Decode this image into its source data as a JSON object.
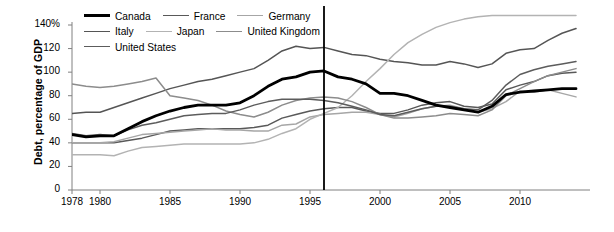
{
  "chart_data": {
    "type": "line",
    "title": "",
    "xlabel": "",
    "ylabel": "Debt, percentage of GDP",
    "xlim": [
      1978,
      2015
    ],
    "ylim": [
      0,
      148
    ],
    "grid": false,
    "legend_position": "top-left",
    "y_ticks": [
      0,
      20,
      40,
      60,
      80,
      100,
      120,
      140
    ],
    "y_tick_labels": [
      "0",
      "20",
      "40",
      "60",
      "80",
      "100",
      "120",
      "140%"
    ],
    "x_ticks": [
      1978,
      1980,
      1985,
      1990,
      1995,
      2000,
      2005,
      2010
    ],
    "x_tick_labels": [
      "1978",
      "1980",
      "1985",
      "1990",
      "1995",
      "2000",
      "2005",
      "2010"
    ],
    "x": [
      1978,
      1979,
      1980,
      1981,
      1982,
      1983,
      1984,
      1985,
      1986,
      1987,
      1988,
      1989,
      1990,
      1991,
      1992,
      1993,
      1994,
      1995,
      1996,
      1997,
      1998,
      1999,
      2000,
      2001,
      2002,
      2003,
      2004,
      2005,
      2006,
      2007,
      2008,
      2009,
      2010,
      2011,
      2012,
      2013,
      2014
    ],
    "annotations": [
      {
        "type": "vertical-line",
        "x": 1996,
        "color": "#000000",
        "label": ""
      }
    ],
    "series": [
      {
        "name": "Canada",
        "color": "#000000",
        "width": 2.8,
        "values": [
          47,
          45,
          46,
          46,
          52,
          58,
          63,
          67,
          70,
          72,
          72,
          72,
          74,
          80,
          88,
          94,
          96,
          100,
          101,
          96,
          94,
          90,
          82,
          82,
          80,
          76,
          72,
          70,
          68,
          66,
          71,
          81,
          83,
          84,
          85,
          86,
          86
        ]
      },
      {
        "name": "France",
        "color": "#595959",
        "width": 1.5,
        "values": [
          40,
          40,
          40,
          40,
          42,
          44,
          47,
          50,
          51,
          52,
          52,
          52,
          52,
          53,
          55,
          61,
          64,
          67,
          69,
          70,
          70,
          67,
          65,
          65,
          68,
          72,
          74,
          75,
          71,
          70,
          73,
          85,
          89,
          92,
          97,
          99,
          100
        ]
      },
      {
        "name": "Germany",
        "color": "#a6a6a6",
        "width": 1.5,
        "values": [
          40,
          40,
          40,
          41,
          44,
          47,
          48,
          49,
          50,
          51,
          52,
          51,
          51,
          50,
          50,
          55,
          56,
          62,
          64,
          65,
          66,
          66,
          64,
          62,
          65,
          69,
          71,
          72,
          69,
          66,
          69,
          75,
          84,
          83,
          85,
          82,
          79
        ]
      },
      {
        "name": "Italy",
        "color": "#555555",
        "width": 1.5,
        "values": [
          65,
          66,
          66,
          70,
          74,
          78,
          82,
          86,
          89,
          92,
          94,
          97,
          100,
          103,
          110,
          118,
          122,
          120,
          121,
          118,
          115,
          114,
          111,
          109,
          108,
          106,
          106,
          109,
          107,
          104,
          107,
          116,
          119,
          120,
          127,
          133,
          137
        ]
      },
      {
        "name": "Japan",
        "color": "#b3b3b3",
        "width": 1.5,
        "values": [
          30,
          30,
          30,
          29,
          33,
          36,
          37,
          38,
          39,
          39,
          39,
          39,
          39,
          40,
          43,
          48,
          52,
          60,
          65,
          70,
          80,
          92,
          103,
          115,
          125,
          132,
          138,
          142,
          145,
          147,
          148,
          148,
          148,
          148,
          148,
          148,
          148
        ]
      },
      {
        "name": "United Kingdom",
        "color": "#8c8c8c",
        "width": 1.5,
        "values": [
          90,
          88,
          87,
          88,
          90,
          92,
          95,
          80,
          78,
          76,
          72,
          67,
          64,
          62,
          66,
          72,
          76,
          78,
          79,
          78,
          75,
          70,
          64,
          61,
          61,
          62,
          63,
          65,
          64,
          63,
          68,
          80,
          86,
          92,
          97,
          100,
          103
        ]
      },
      {
        "name": "United States",
        "color": "#5c5c5c",
        "width": 1.5,
        "values": [
          48,
          46,
          47,
          46,
          51,
          55,
          57,
          60,
          63,
          64,
          65,
          65,
          68,
          72,
          75,
          77,
          77,
          77,
          76,
          74,
          71,
          68,
          64,
          63,
          66,
          69,
          71,
          71,
          69,
          68,
          76,
          89,
          98,
          102,
          105,
          107,
          109
        ]
      }
    ]
  },
  "legend": {
    "rows": [
      [
        {
          "label": "Canada",
          "color": "#000000",
          "width": 3.2
        },
        {
          "label": "France",
          "color": "#595959",
          "width": 1.7
        },
        {
          "label": "Germany",
          "color": "#a6a6a6",
          "width": 1.7
        }
      ],
      [
        {
          "label": "Italy",
          "color": "#555555",
          "width": 1.7
        },
        {
          "label": "Japan",
          "color": "#b3b3b3",
          "width": 1.7
        },
        {
          "label": "United Kingdom",
          "color": "#8c8c8c",
          "width": 1.7
        }
      ],
      [
        {
          "label": "United States",
          "color": "#5c5c5c",
          "width": 1.7
        }
      ]
    ]
  },
  "axis": {
    "color": "#808080"
  }
}
